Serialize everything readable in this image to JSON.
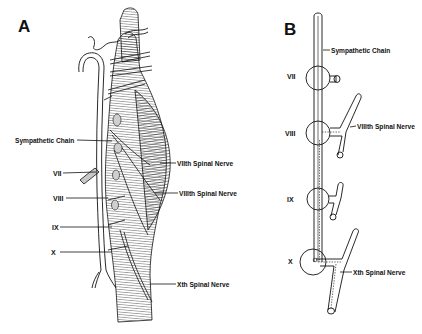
{
  "figure": {
    "panels": [
      {
        "id": "A",
        "letter": "A",
        "description": "Dissection-style illustration of the sympathetic chain and ganglia alongside spinal nerves",
        "labels_left": {
          "sympathetic_chain": "Sympathetic Chain",
          "vii": "VII",
          "viii": "VIII",
          "ix": "IX",
          "x": "X"
        },
        "labels_right": {
          "viith_spinal_nerve": "VIIth Spinal Nerve",
          "viiith_spinal_nerve": "VIIIth Spinal Nerve",
          "xth_spinal_nerve": "Xth Spinal Nerve"
        }
      },
      {
        "id": "B",
        "letter": "B",
        "description": "Schematic of the sympathetic chain with ganglia VII–X and connections to spinal nerves",
        "labels": {
          "sympathetic_chain": "Sympathetic Chain",
          "vii": "VII",
          "viii": "VIII",
          "ix": "IX",
          "x": "X",
          "viiith_spinal_nerve": "VIIIth Spinal Nerve",
          "xth_spinal_nerve": "Xth Spinal Nerve"
        }
      }
    ],
    "colors": {
      "ink": "#111111",
      "background": "#ffffff",
      "shade": "#8a8a8a"
    }
  }
}
